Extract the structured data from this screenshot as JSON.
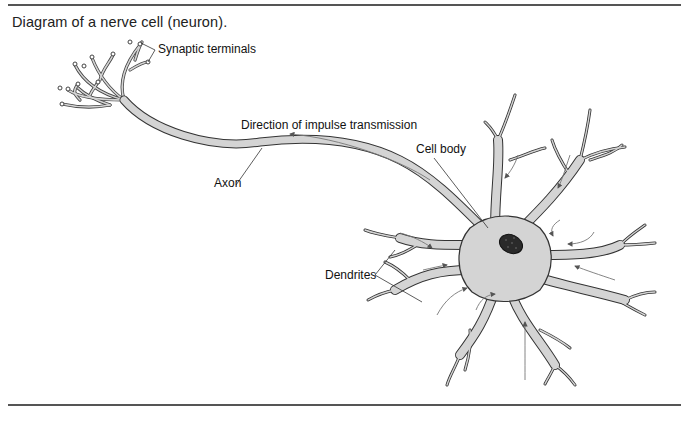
{
  "caption": "Diagram of a nerve cell (neuron).",
  "labels": {
    "synaptic_terminals": "Synaptic terminals",
    "direction": "Direction of impulse transmission",
    "cell_body": "Cell body",
    "axon": "Axon",
    "dendrites": "Dendrites"
  },
  "colors": {
    "cell_fill": "#d4d4d4",
    "outline": "#333333",
    "nucleus": "#2a2a2a",
    "rule": "#555555"
  }
}
